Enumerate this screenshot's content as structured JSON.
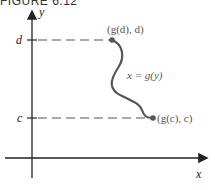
{
  "figure": {
    "title": "FIGURE 6.12",
    "axes": {
      "x_label": "x",
      "y_label": "y"
    },
    "ticks": {
      "top": "d",
      "bottom": "c"
    },
    "annotations": {
      "top_point": "(g(d), d)",
      "bottom_point": "(g(c), c)",
      "curve_label": "x = g(y)"
    },
    "colors": {
      "axis": "#222222",
      "curve": "#555555",
      "dashed": "#555555"
    }
  }
}
